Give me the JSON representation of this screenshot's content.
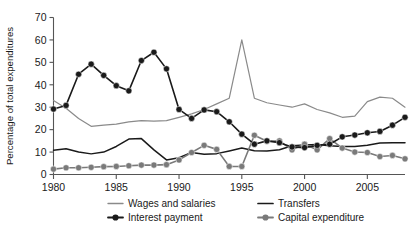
{
  "chart_data": {
    "type": "line",
    "title": "",
    "xlabel": "",
    "ylabel": "Percentage of total expenditures",
    "xlim": [
      1980,
      2008
    ],
    "ylim": [
      0,
      70
    ],
    "ytick_values": [
      0,
      10,
      20,
      30,
      40,
      50,
      60,
      70
    ],
    "ytick_labels": [
      "0",
      "10",
      "20",
      "30",
      "40",
      "50",
      "60",
      "70"
    ],
    "xtick_values": [
      1980,
      1985,
      1990,
      1995,
      2000,
      2005
    ],
    "xtick_labels": [
      "1980",
      "1985",
      "1990",
      "1995",
      "2000",
      "2005"
    ],
    "grid": false,
    "legend_position": "bottom",
    "x": [
      1980,
      1981,
      1982,
      1983,
      1984,
      1985,
      1986,
      1987,
      1988,
      1989,
      1990,
      1991,
      1992,
      1993,
      1994,
      1995,
      1996,
      1997,
      1998,
      1999,
      2000,
      2001,
      2002,
      2003,
      2004,
      2005,
      2006,
      2007,
      2008
    ],
    "series": [
      {
        "name": "Wages and salaries",
        "color": "#8a8a8a",
        "marker": "none",
        "linewidth": 1.2,
        "values": [
          33.0,
          29.5,
          25.0,
          21.5,
          22.0,
          22.5,
          23.5,
          24.0,
          23.8,
          24.0,
          25.5,
          27.0,
          29.0,
          31.5,
          34.0,
          60.0,
          34.0,
          32.0,
          31.0,
          30.0,
          31.5,
          29.0,
          27.5,
          25.5,
          26.0,
          32.5,
          34.5,
          34.0,
          30.0
        ]
      },
      {
        "name": "Interest payment",
        "color": "#1a1a1a",
        "marker": "circle-filled-dark",
        "linewidth": 1.6,
        "values": [
          29.2,
          30.8,
          44.7,
          49.2,
          44.2,
          39.6,
          37.3,
          50.8,
          54.5,
          47.1,
          29.0,
          25.0,
          28.8,
          28.0,
          23.5,
          18.0,
          13.5,
          15.0,
          14.2,
          12.3,
          12.0,
          13.0,
          13.5,
          16.8,
          17.6,
          18.6,
          19.2,
          22.0,
          25.5
        ]
      },
      {
        "name": "Transfers",
        "color": "#1a1a1a",
        "marker": "none",
        "linewidth": 1.5,
        "values": [
          10.8,
          11.5,
          10.0,
          9.2,
          10.0,
          12.5,
          15.8,
          16.0,
          11.0,
          6.5,
          7.5,
          9.8,
          9.0,
          9.3,
          10.5,
          11.8,
          10.6,
          10.5,
          11.0,
          12.8,
          13.2,
          13.4,
          12.8,
          12.5,
          12.5,
          13.0,
          14.0,
          14.2,
          14.2
        ]
      },
      {
        "name": "Capital expenditure",
        "color": "#7a7a7a",
        "marker": "circle-filled-gray",
        "linewidth": 1.6,
        "values": [
          2.4,
          3.0,
          3.0,
          3.2,
          3.5,
          3.6,
          3.9,
          4.2,
          4.2,
          4.4,
          6.5,
          9.8,
          13.0,
          11.2,
          3.6,
          3.6,
          17.5,
          14.8,
          15.0,
          11.0,
          13.5,
          11.0,
          16.0,
          11.8,
          10.0,
          9.8,
          8.0,
          8.5,
          7.0
        ]
      }
    ]
  },
  "legend": {
    "entries": [
      {
        "label": "Wages and salaries",
        "marker": "line-gray"
      },
      {
        "label": "Interest payment",
        "marker": "line-dot-dark"
      },
      {
        "label": "Transfers",
        "marker": "line-dark"
      },
      {
        "label": "Capital expenditure",
        "marker": "line-dot-gray"
      }
    ]
  },
  "colors": {
    "wages": "#8a8a8a",
    "interest": "#1a1a1a",
    "transfers": "#1a1a1a",
    "capital": "#7a7a7a",
    "axis": "#555555",
    "background": "#ffffff"
  }
}
